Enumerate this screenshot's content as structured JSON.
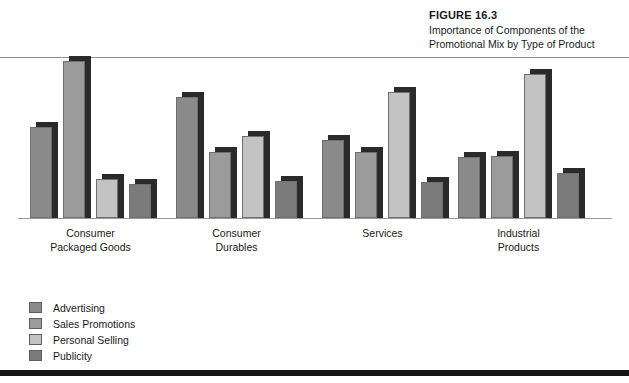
{
  "figure": {
    "number_label": "FIGURE 16.3",
    "title": "Importance of Components of the\nPromotional Mix by Type of Product"
  },
  "colors": {
    "advertising": "#8a8a8a",
    "sales_promotions": "#9b9b9b",
    "personal_selling": "#c3c3c3",
    "publicity": "#7b7b7b",
    "shadow": "#2a2a2a",
    "rule_top": "#8d8d8d",
    "rule_bottom": "#141414",
    "baseline": "#9a9a9a",
    "text": "#1a1a1a"
  },
  "legend": {
    "position": "bottom-left",
    "items": [
      {
        "label": "Advertising",
        "color": "#8a8a8a"
      },
      {
        "label": "Sales Promotions",
        "color": "#9b9b9b"
      },
      {
        "label": "Personal Selling",
        "color": "#c3c3c3"
      },
      {
        "label": "Publicity",
        "color": "#7b7b7b"
      }
    ]
  },
  "categories": [
    {
      "label": "Consumer\nPackaged Goods"
    },
    {
      "label": "Consumer\nDurables"
    },
    {
      "label": "Services"
    },
    {
      "label": "Industrial\nProducts"
    }
  ],
  "chart_data": {
    "type": "bar",
    "title": "Importance of Components of the Promotional Mix by Type of Product",
    "subtitle": "FIGURE 16.3",
    "xlabel": "",
    "ylabel": "",
    "ylim": [
      0,
      100
    ],
    "grid": false,
    "legend_position": "bottom-left",
    "axis_ticks_visible": false,
    "categories": [
      "Consumer Packaged Goods",
      "Consumer Durables",
      "Services",
      "Industrial Products"
    ],
    "series": [
      {
        "name": "Advertising",
        "color": "#8a8a8a",
        "values": [
          51,
          68,
          44,
          34
        ]
      },
      {
        "name": "Sales Promotions",
        "color": "#9b9b9b",
        "values": [
          88,
          37,
          37,
          35
        ]
      },
      {
        "name": "Personal Selling",
        "color": "#c3c3c3",
        "values": [
          22,
          46,
          71,
          81
        ]
      },
      {
        "name": "Publicity",
        "color": "#7b7b7b",
        "values": [
          19,
          21,
          20,
          25
        ]
      }
    ]
  }
}
